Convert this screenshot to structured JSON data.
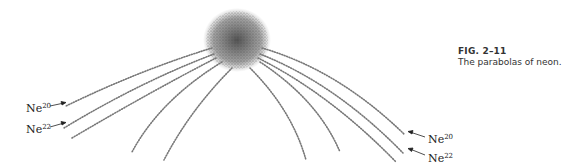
{
  "caption": {
    "figure_number": "FIG. 2–11",
    "text": "The parabolas of neon."
  },
  "labels": {
    "left_top": {
      "element": "Ne",
      "mass": "20"
    },
    "left_bottom": {
      "element": "Ne",
      "mass": "22"
    },
    "right_top": {
      "element": "Ne",
      "mass": "20"
    },
    "right_bottom": {
      "element": "Ne",
      "mass": "22"
    }
  },
  "colors": {
    "dots": "#555555",
    "text": "#333333"
  }
}
